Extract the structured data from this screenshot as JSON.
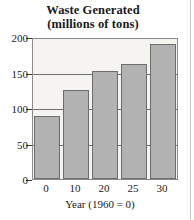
{
  "chart_data": {
    "type": "bar",
    "title": "Waste Generated (millions of tons)",
    "title_line1": "Waste Generated",
    "title_line2": "(millions of tons)",
    "categories": [
      "0",
      "10",
      "20",
      "25",
      "30"
    ],
    "values": [
      90,
      127,
      154,
      165,
      193
    ],
    "xlabel": "Year (1960 = 0)",
    "ylabel": "",
    "ylim": [
      0,
      200
    ],
    "yticks": [
      0,
      50,
      100,
      150,
      200
    ],
    "ytick_labels": [
      "0",
      "50",
      "100",
      "150",
      "200"
    ],
    "grid": true,
    "legend": null,
    "colors": {
      "bar_fill": "#b2b2b2",
      "bar_edge": "#6d6d6d",
      "plot_background": "#f5f4f1",
      "page_background": "#ffffff",
      "gridline": "#6f6f6f",
      "text": "#1a1a1a"
    }
  }
}
